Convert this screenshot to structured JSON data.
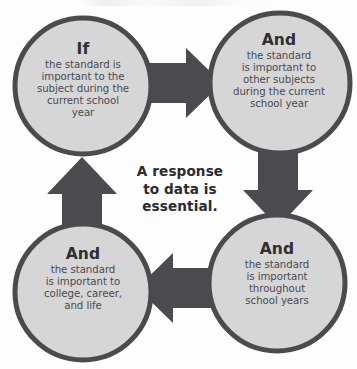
{
  "diagram": {
    "title_center": {
      "lines": [
        "A response",
        "to data is",
        "essential."
      ]
    },
    "colors": {
      "circle_fill": "#d6d6d6",
      "circle_stroke": "#4a4a4f",
      "arrow_fill": "#4a4a4f",
      "heading_text": "#2e2e33",
      "body_text": "#4a4a50",
      "background": "#fdfdfd"
    },
    "nodes": [
      {
        "id": "top-left",
        "heading": "If",
        "body_lines": [
          "the standard is",
          "important to the",
          "subject during the",
          "current school",
          "year"
        ]
      },
      {
        "id": "top-right",
        "heading": "And",
        "body_lines": [
          "the standard",
          "is important to",
          "other subjects",
          "during the current",
          "school year"
        ]
      },
      {
        "id": "bottom-right",
        "heading": "And",
        "body_lines": [
          "the standard",
          "is important",
          "throughout",
          "school years"
        ]
      },
      {
        "id": "bottom-left",
        "heading": "And",
        "body_lines": [
          "the standard",
          "is important to",
          "college, career,",
          "and life"
        ]
      }
    ],
    "arrows": [
      {
        "id": "arrow-right",
        "direction": "right",
        "from": "top-left",
        "to": "top-right"
      },
      {
        "id": "arrow-down",
        "direction": "down",
        "from": "top-right",
        "to": "bottom-right"
      },
      {
        "id": "arrow-left",
        "direction": "left",
        "from": "bottom-right",
        "to": "bottom-left"
      },
      {
        "id": "arrow-up",
        "direction": "up",
        "from": "bottom-left",
        "to": "top-left"
      }
    ]
  }
}
